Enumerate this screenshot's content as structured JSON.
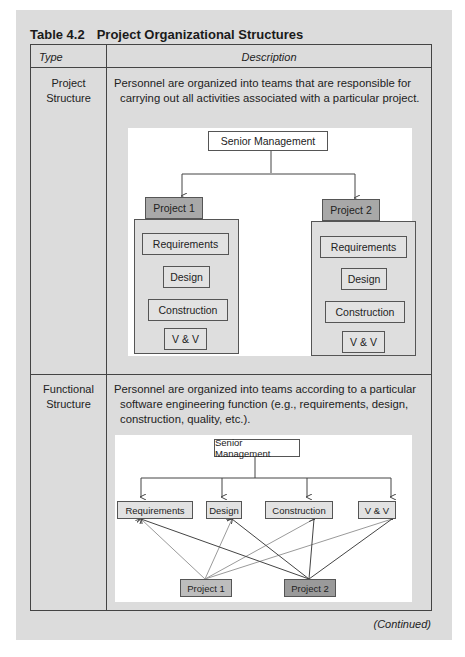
{
  "table": {
    "number": "Table 4.2",
    "title": "Project Organizational Structures",
    "headers": {
      "type": "Type",
      "description": "Description"
    },
    "rows": [
      {
        "type_line1": "Project",
        "type_line2": "Structure",
        "description": "Personnel are organized into teams that are responsible for carrying out all activities associated with a particular project.",
        "diagram": {
          "top": "Senior Management",
          "projects": [
            {
              "label": "Project 1",
              "functions": [
                "Requirements",
                "Design",
                "Construction",
                "V & V"
              ]
            },
            {
              "label": "Project 2",
              "functions": [
                "Requirements",
                "Design",
                "Construction",
                "V & V"
              ]
            }
          ]
        }
      },
      {
        "type_line1": "Functional",
        "type_line2": "Structure",
        "description": "Personnel are organized into teams according to a particular software engineering function (e.g., requirements, design, construction, quality, etc.).",
        "diagram": {
          "top": "Senior Management",
          "functions": [
            "Requirements",
            "Design",
            "Construction",
            "V & V"
          ],
          "projects": [
            "Project 1",
            "Project 2"
          ]
        }
      }
    ],
    "footer": "(Continued)"
  }
}
